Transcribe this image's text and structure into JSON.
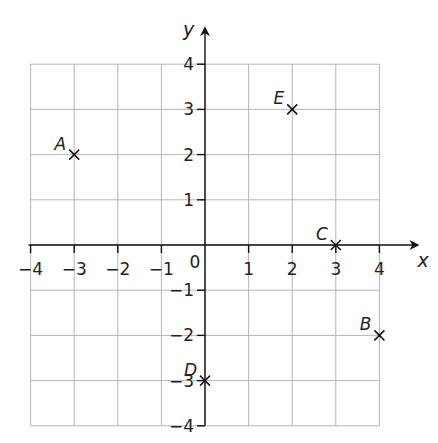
{
  "chart_data": {
    "type": "scatter",
    "title": "",
    "xlabel": "x",
    "ylabel": "y",
    "xlim": [
      -4,
      4
    ],
    "ylim": [
      -4,
      4
    ],
    "grid": true,
    "x_ticks": [
      -4,
      -3,
      -2,
      -1,
      0,
      1,
      2,
      3,
      4
    ],
    "y_ticks": [
      -4,
      -3,
      -2,
      -1,
      1,
      2,
      3,
      4
    ],
    "x_tick_labels": [
      "−4",
      "−3",
      "−2",
      "−1",
      "1",
      "2",
      "3",
      "4"
    ],
    "y_tick_labels": [
      "4",
      "3",
      "2",
      "1",
      "−1",
      "−2",
      "−3",
      "−4"
    ],
    "origin_label": "0",
    "points": [
      {
        "label": "A",
        "x": -3,
        "y": 2
      },
      {
        "label": "B",
        "x": 4,
        "y": -2
      },
      {
        "label": "C",
        "x": 3,
        "y": 0
      },
      {
        "label": "D",
        "x": 0,
        "y": -3
      },
      {
        "label": "E",
        "x": 2,
        "y": 3
      }
    ],
    "marker": "x"
  }
}
